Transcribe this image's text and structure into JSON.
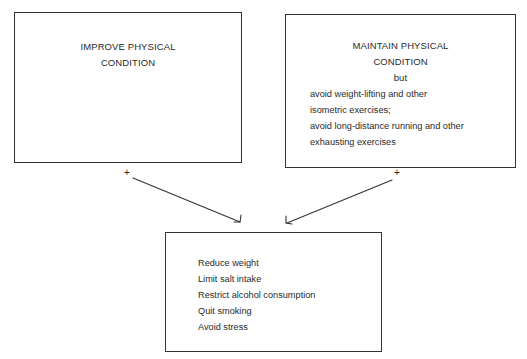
{
  "boxes": {
    "improve": {
      "title_lines": [
        "IMPROVE PHYSICAL",
        "CONDITION"
      ]
    },
    "maintain": {
      "title_lines": [
        "MAINTAIN PHYSICAL",
        "CONDITION",
        "but"
      ],
      "lines": [
        "avoid weight-lifting and other",
        "isometric exercises;",
        "avoid long-distance running and other",
        "exhausting exercises"
      ]
    },
    "lifestyle": {
      "lines": [
        "Reduce weight",
        "Limit salt intake",
        "Restrict alcohol consumption",
        "Quit smoking",
        "Avoid stress"
      ]
    }
  },
  "connectors": {
    "left_sign": "+",
    "right_sign": "+"
  }
}
